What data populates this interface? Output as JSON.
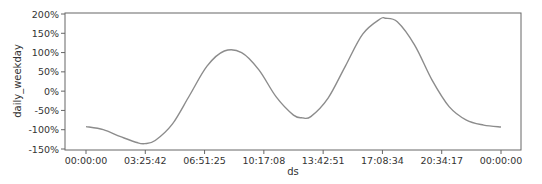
{
  "chart_data": {
    "type": "line",
    "title": "",
    "xlabel": "ds",
    "ylabel": "daily_weekday",
    "x_ticks": [
      "00:00:00",
      "03:25:42",
      "06:51:25",
      "10:17:08",
      "13:42:51",
      "17:08:34",
      "20:34:17",
      "00:00:00"
    ],
    "y_ticks": [
      "200%",
      "150%",
      "100%",
      "50%",
      "0%",
      "-50%",
      "-100%",
      "-150%"
    ],
    "y_tick_values": [
      200,
      150,
      100,
      50,
      0,
      -50,
      -100,
      -150
    ],
    "ylim": [
      -152,
      203
    ],
    "xlim_hours": [
      -0.95,
      24.4
    ],
    "grid": false,
    "legend": null,
    "series": [
      {
        "name": "daily_weekday",
        "color": "#8c8c8c",
        "x_hours": [
          0,
          1,
          2,
          3,
          3.4,
          4,
          5,
          6,
          7,
          8,
          9,
          10,
          11,
          12,
          12.5,
          13,
          14,
          15,
          16,
          17,
          17.3,
          18,
          19,
          20,
          21,
          22,
          23,
          24
        ],
        "values": [
          -92,
          -100,
          -118,
          -134,
          -136,
          -128,
          -85,
          -10,
          65,
          104,
          100,
          55,
          -15,
          -62,
          -69,
          -66,
          -18,
          65,
          148,
          187,
          189,
          180,
          120,
          30,
          -40,
          -75,
          -88,
          -93
        ]
      }
    ]
  }
}
